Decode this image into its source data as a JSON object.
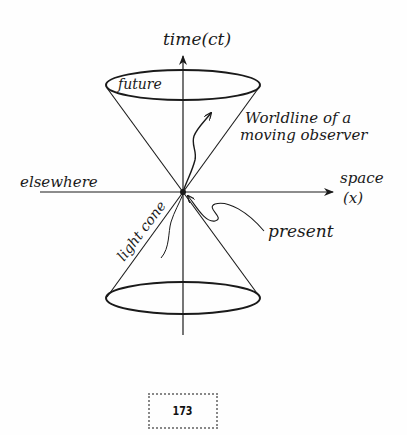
{
  "diagram": {
    "axes": {
      "time_label": "time(ct)",
      "space_label_line1": "space",
      "space_label_line2": "(x)"
    },
    "regions": {
      "future": "future",
      "elsewhere": "elsewhere",
      "present": "present"
    },
    "annotations": {
      "worldline_line1": "Worldline of a",
      "worldline_line2": "moving observer",
      "light_cone": "light cone"
    },
    "colors": {
      "ink": "#1a1a1a",
      "background": "#fefefe"
    }
  },
  "page": {
    "number": "173"
  }
}
